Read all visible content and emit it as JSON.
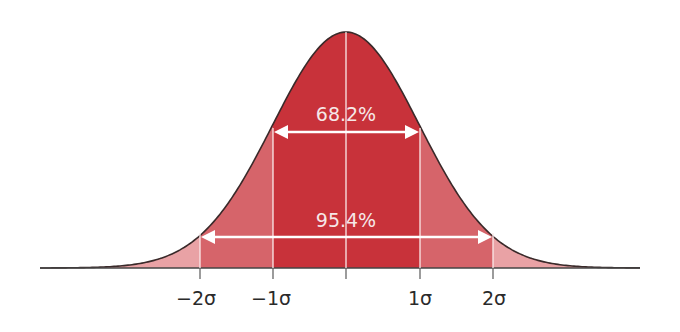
{
  "chart_data": {
    "type": "area",
    "title": "",
    "xlabel": "",
    "ylabel": "",
    "x_ticks": [
      "−2σ",
      "−1σ",
      "",
      "1σ",
      "2σ"
    ],
    "bands": [
      {
        "name": "within 1 sigma",
        "range": [
          -1,
          1
        ],
        "percent": 68.2,
        "label": "68.2%",
        "color": "#c8323a"
      },
      {
        "name": "within 2 sigma",
        "range": [
          -2,
          2
        ],
        "percent": 95.4,
        "label": "95.4%",
        "color": "#d9686e"
      },
      {
        "name": "tails",
        "range": [
          -3,
          3
        ],
        "color": "#e8a0a3"
      }
    ],
    "mean_line": 0,
    "grid": false,
    "legend": null
  },
  "labels": {
    "one_sigma_pct": "68.2%",
    "two_sigma_pct": "95.4%",
    "tick_neg2": "−2σ",
    "tick_neg1": "−1σ",
    "tick_pos1": "1σ",
    "tick_pos2": "2σ"
  },
  "colors": {
    "inner": "#c8323a",
    "middle": "#d6646a",
    "outer": "#e9a2a5",
    "outline": "#3a2a2a",
    "axis": "#444444",
    "arrow": "#ffffff"
  }
}
